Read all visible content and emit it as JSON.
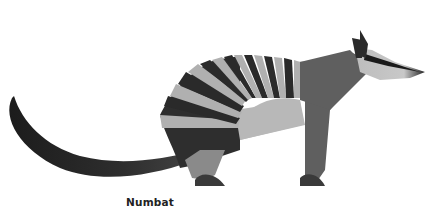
{
  "figure": {
    "caption": "Numbat",
    "colors": {
      "dark": "#2a2a2a",
      "mid": "#5f5f5f",
      "light": "#b4b4b4",
      "background": "#ffffff"
    }
  }
}
